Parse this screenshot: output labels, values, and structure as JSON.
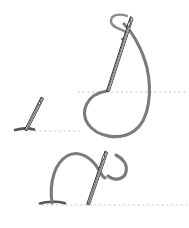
{
  "figure": {
    "background_color": "#ffffff",
    "thread_color": "#7b7b7b",
    "needle_outline_color": "#1c1c1c",
    "needle_fill_color": "#ffffff",
    "fabric_line_color": "#b9b9b9",
    "entry_mark_color": "#555555",
    "step_count": 3
  },
  "steps": [
    {
      "id": "step-top",
      "order": 1,
      "name": "needle-with-large-thread-loop",
      "label": "",
      "fabric_line": {
        "y": 92,
        "x_start": 78,
        "x_end": 187
      },
      "needle": {
        "tip_x": 107,
        "tip_y": 91,
        "eye_x": 131,
        "eye_y": 18,
        "length": 77,
        "angle_deg": 18
      },
      "thread_loop": "large-u-loop-below-fabric-line",
      "entry_point": {
        "x": 107,
        "y": 91
      }
    },
    {
      "id": "step-middle",
      "order": 2,
      "name": "needle-entering-fabric",
      "label": "",
      "fabric_line": {
        "y": 131,
        "x_start": 30,
        "x_end": 80
      },
      "needle": {
        "tip_x": 26,
        "tip_y": 130,
        "eye_x": 42,
        "eye_y": 98,
        "length": 36,
        "angle_deg": 27
      },
      "thread_loop": "none",
      "entry_point": {
        "x": 26,
        "y": 130
      }
    },
    {
      "id": "step-bottom",
      "order": 3,
      "name": "needle-with-arched-thread-loop",
      "label": "",
      "fabric_line": {
        "y": 205,
        "x_start": 42,
        "x_end": 187
      },
      "needle": {
        "tip_x": 88,
        "tip_y": 204,
        "eye_x": 106,
        "eye_y": 152,
        "length": 55,
        "angle_deg": 19
      },
      "thread_loop": "arch-over-fabric-plus-small-hook",
      "entry_point": {
        "x": 52,
        "y": 203
      }
    }
  ],
  "elements": {
    "fabric_line_name": "fabric-surface-line",
    "needle_name": "sewing-needle",
    "thread_name": "thread-loop",
    "entry_mark_name": "thread-entry-mark"
  }
}
